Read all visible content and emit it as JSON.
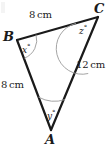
{
  "figure": {
    "type": "triangle-geometry-diagram",
    "stroke_color": "#1a1a1a",
    "arc_color": "#8a8a8a",
    "background_color": "#ffffff",
    "vertices": [
      {
        "name": "A",
        "label": "A",
        "x": 51,
        "y": 130
      },
      {
        "name": "B",
        "label": "B",
        "x": 17,
        "y": 40
      },
      {
        "name": "C",
        "label": "C",
        "x": 98,
        "y": 17
      }
    ],
    "sides": [
      {
        "name": "BC",
        "label": "8 cm",
        "value": "8",
        "unit": "cm"
      },
      {
        "name": "BA",
        "label": "8 cm",
        "value": "8",
        "unit": "cm"
      },
      {
        "name": "CA",
        "label": "12 cm",
        "value": "12",
        "unit": "cm"
      }
    ],
    "angles": [
      {
        "name": "B",
        "variable": "x",
        "label": "x°",
        "degree_symbol": "°"
      },
      {
        "name": "C",
        "variable": "z",
        "label": "z°",
        "degree_symbol": "°"
      },
      {
        "name": "A",
        "variable": "y",
        "label": "y°",
        "degree_symbol": "°"
      }
    ]
  },
  "labels": {
    "vertex_a": "A",
    "vertex_b": "B",
    "vertex_c": "C",
    "side_bc_value": "8",
    "side_bc_unit": "cm",
    "side_ba_value": "8",
    "side_ba_unit": "cm",
    "side_ca_value": "12",
    "side_ca_unit": "cm",
    "angle_x_var": "x",
    "angle_x_deg": "°",
    "angle_y_var": "y",
    "angle_y_deg": "°",
    "angle_z_var": "z",
    "angle_z_deg": "°"
  }
}
